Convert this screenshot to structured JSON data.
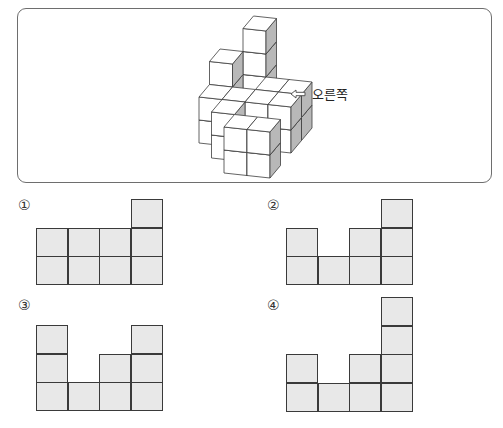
{
  "figure": {
    "direction_label": "오른쪽",
    "direction_arrow_icon": "left-arrow-outline-icon",
    "colors": {
      "top": "#ffffff",
      "front": "#ffffff",
      "side": "#b8b8b8",
      "edge": "#3c3c3c",
      "box_border": "#6e6e6e"
    },
    "projection": {
      "origin": [
        178,
        168
      ],
      "x": [
        23,
        2.5
      ],
      "y": [
        0,
        -23
      ],
      "z": [
        10.5,
        -12.5
      ]
    },
    "cubes": [
      [
        1,
        4,
        0
      ],
      [
        1,
        4,
        1
      ],
      [
        1,
        4,
        2
      ],
      [
        1,
        4,
        3
      ],
      [
        0,
        3,
        0
      ],
      [
        0,
        3,
        1
      ],
      [
        0,
        3,
        2
      ],
      [
        0,
        2,
        0
      ],
      [
        0,
        2,
        1
      ],
      [
        1,
        2,
        0
      ],
      [
        1,
        2,
        1
      ],
      [
        2,
        3,
        0
      ],
      [
        2,
        3,
        1
      ],
      [
        3,
        3,
        0
      ],
      [
        3,
        3,
        1
      ],
      [
        2,
        2,
        0
      ],
      [
        2,
        2,
        1
      ],
      [
        3,
        2,
        0
      ],
      [
        3,
        2,
        1
      ],
      [
        1,
        1,
        0
      ],
      [
        1,
        1,
        1
      ],
      [
        2,
        0,
        0
      ],
      [
        3,
        0,
        0
      ],
      [
        3,
        0,
        1
      ],
      [
        2,
        0,
        1
      ]
    ]
  },
  "options": [
    {
      "label": "①",
      "num_pos": [
        18,
        197
      ],
      "grid_origin": [
        36,
        199
      ],
      "heights": [
        2,
        2,
        2,
        3
      ],
      "max_rows": 3
    },
    {
      "label": "②",
      "num_pos": [
        267,
        197
      ],
      "grid_origin": [
        286,
        199
      ],
      "heights": [
        2,
        1,
        2,
        3
      ],
      "max_rows": 3
    },
    {
      "label": "③",
      "num_pos": [
        18,
        297
      ],
      "grid_origin": [
        36,
        325
      ],
      "heights": [
        3,
        1,
        2,
        3
      ],
      "max_rows": 3
    },
    {
      "label": "④",
      "num_pos": [
        267,
        297
      ],
      "grid_origin": [
        286,
        297
      ],
      "heights": [
        2,
        1,
        2,
        4
      ],
      "max_rows": 4
    }
  ]
}
